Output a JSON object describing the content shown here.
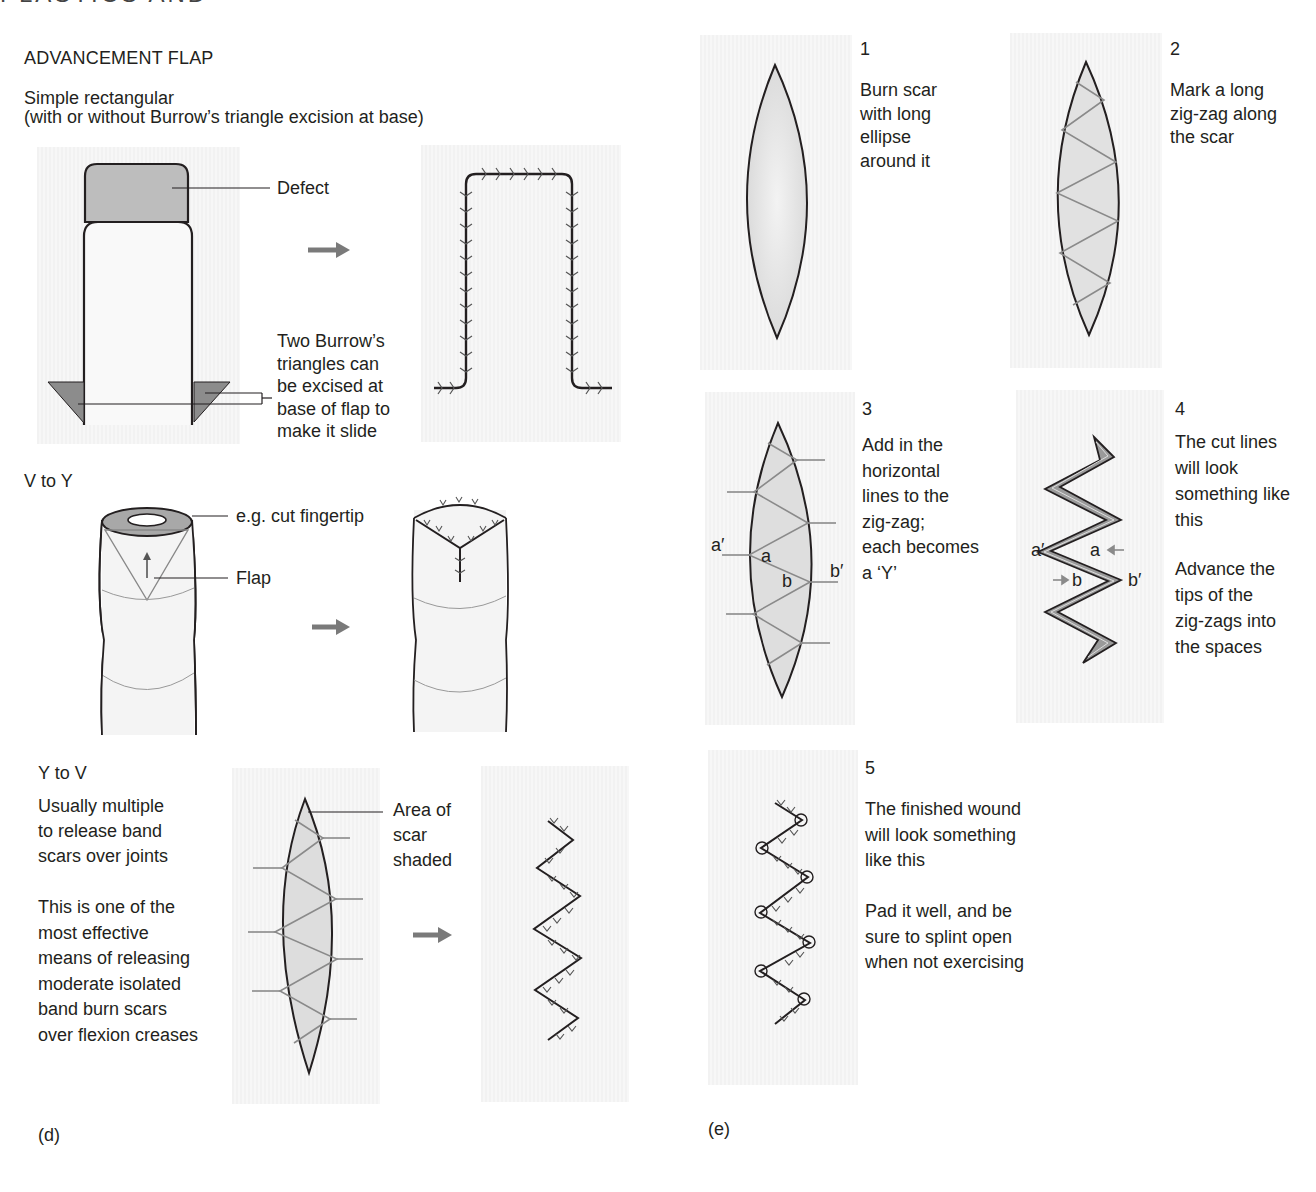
{
  "page": {
    "running_header_cropped": "PLASTICS AND BURNS",
    "figure_labels": {
      "left": "(d)",
      "right": "(e)"
    }
  },
  "colors": {
    "panel_bg": "#f4f4f4",
    "ink": "#231f20",
    "shade_dark": "#8c8c8c",
    "shade_light": "#e3e3e3",
    "guide_line": "#8a8a8a",
    "arrow": "#7a7a7a"
  },
  "left_column": {
    "advancement": {
      "title": "ADVANCEMENT FLAP",
      "subtitle_line1": "Simple rectangular",
      "subtitle_line2": "(with or without Burrow’s triangle excision at base)",
      "callout_defect": "Defect",
      "callout_burrow": "Two Burrow’s\ntriangles can\nbe excised at\nbase of flap to\nmake it slide"
    },
    "v_to_y": {
      "title": "V to Y",
      "callout_fingertip": "e.g. cut fingertip",
      "callout_flap": "Flap"
    },
    "y_to_v": {
      "title": "Y to V",
      "note1": "Usually multiple\nto release band\nscars over joints",
      "note2": "This is one of the\nmost effective\nmeans of releasing\nmoderate isolated\nband burn scars\nover flexion creases",
      "callout_area": "Area of\nscar\nshaded"
    }
  },
  "right_column": {
    "steps": [
      {
        "number": "1",
        "text": "Burn scar\nwith long\nellipse\naround it"
      },
      {
        "number": "2",
        "text": "Mark a long\nzig-zag along\nthe scar"
      },
      {
        "number": "3",
        "text": "Add in the\nhorizontal\nlines to the\nzig-zag;\neach becomes\na ‘Y’"
      },
      {
        "number": "4",
        "text": "The cut lines\nwill look\nsomething like\nthis",
        "text2": "Advance the\ntips of the\nzig-zags into\nthe spaces"
      },
      {
        "number": "5",
        "text": "The finished wound\nwill look something\nlike this",
        "text2": "Pad it well, and be\nsure to splint open\nwhen not exercising"
      }
    ],
    "diagram_labels": {
      "a_prime": "a′",
      "a": "a",
      "b": "b",
      "b_prime": "b′"
    }
  }
}
